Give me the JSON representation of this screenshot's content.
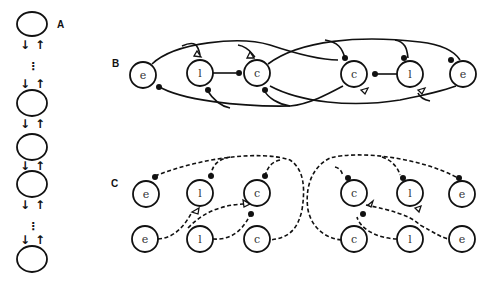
{
  "panels": {
    "A": {
      "label": "A",
      "down_arrow": "↓",
      "up_arrow": "↑",
      "ellipsis": "⋮"
    },
    "B": {
      "label": "B",
      "nodes": [
        "e",
        "l",
        "c",
        "c",
        "l",
        "e"
      ]
    },
    "C": {
      "label": "C",
      "top_nodes": [
        "e",
        "l",
        "c",
        "c",
        "l",
        "e"
      ],
      "bottom_nodes": [
        "e",
        "l",
        "c",
        "c",
        "l",
        "e"
      ]
    }
  },
  "colors": {
    "stroke": "#111111",
    "background": "#ffffff"
  }
}
